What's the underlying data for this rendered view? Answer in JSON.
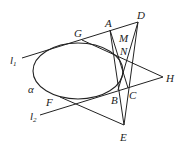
{
  "diagram": {
    "type": "geometry",
    "ellipse": {
      "label": "α",
      "cx": 78,
      "cy": 71,
      "rx": 45,
      "ry": 28
    },
    "points": {
      "A": [
        110,
        30
      ],
      "D": [
        138,
        22
      ],
      "G": [
        82,
        40
      ],
      "H": [
        163,
        77
      ],
      "B": [
        118,
        90
      ],
      "C": [
        128,
        88
      ],
      "E": [
        124,
        125
      ],
      "F": [
        60,
        97
      ]
    },
    "labels": {
      "A": "A",
      "D": "D",
      "G": "G",
      "H": "H",
      "B": "B",
      "C": "C",
      "E": "E",
      "F": "F",
      "M": "M",
      "N": "N",
      "alpha": "α",
      "l1": "l",
      "l1_sub": "1",
      "l2": "l",
      "l2_sub": "2"
    }
  }
}
